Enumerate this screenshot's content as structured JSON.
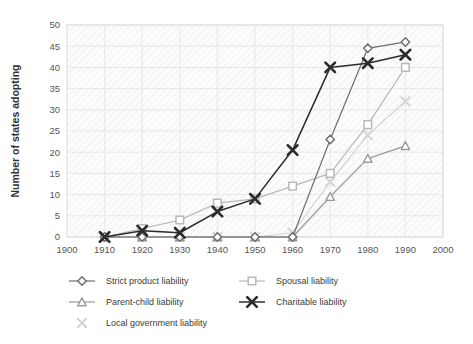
{
  "chart_data": {
    "type": "line",
    "title": "",
    "xlabel": "",
    "ylabel": "Number of states adopting",
    "xlim": [
      1900,
      2000
    ],
    "ylim": [
      0,
      50
    ],
    "xticks": [
      1900,
      1910,
      1920,
      1930,
      1940,
      1950,
      1960,
      1970,
      1980,
      1990,
      2000
    ],
    "yticks": [
      0,
      5,
      10,
      15,
      20,
      25,
      30,
      35,
      40,
      45,
      50
    ],
    "x": [
      1910,
      1920,
      1930,
      1940,
      1950,
      1960,
      1970,
      1980,
      1990
    ],
    "grid": true,
    "legend_position": "bottom",
    "series": [
      {
        "name": "Strict product liability",
        "marker": "diamond",
        "color": "#6e6e6e",
        "values": [
          0,
          0,
          0,
          0,
          0,
          0,
          23,
          44.5,
          46
        ]
      },
      {
        "name": "Spousal liability",
        "marker": "square",
        "color": "#b9b9b9",
        "values": [
          0,
          2,
          4,
          8,
          9,
          12,
          15,
          26.5,
          40
        ]
      },
      {
        "name": "Parent-child liability",
        "marker": "triangle",
        "color": "#9a9a9a",
        "values": [
          0,
          0,
          0,
          0,
          0,
          0,
          9.5,
          18.5,
          21.5
        ]
      },
      {
        "name": "Charitable liability",
        "marker": "x-bold",
        "color": "#2b2b2b",
        "values": [
          0,
          1.5,
          1,
          6,
          9,
          20.5,
          40,
          41,
          43
        ]
      },
      {
        "name": "Local government liability",
        "marker": "x-light",
        "color": "#d4d4d4",
        "values": [
          0,
          0,
          0,
          0,
          0,
          1,
          13,
          24,
          32
        ]
      }
    ]
  },
  "legend": {
    "items": [
      {
        "label": "Strict product liability"
      },
      {
        "label": "Spousal liability"
      },
      {
        "label": "Parent-child liability"
      },
      {
        "label": "Charitable liability"
      },
      {
        "label": "Local government liability"
      }
    ]
  }
}
